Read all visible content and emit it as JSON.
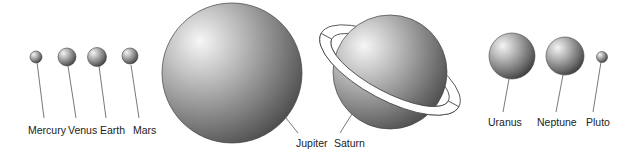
{
  "planets": [
    {
      "name": "Mercury"
    },
    {
      "name": "Venus"
    },
    {
      "name": "Earth"
    },
    {
      "name": "Mars"
    },
    {
      "name": "Jupiter"
    },
    {
      "name": "Saturn"
    },
    {
      "name": "Uranus"
    },
    {
      "name": "Neptune"
    },
    {
      "name": "Pluto"
    }
  ],
  "colors": {
    "sphere_light": "#f2f2f2",
    "sphere_mid": "#9a9a9a",
    "sphere_dark": "#3c3c3c",
    "outline": "#444444",
    "leader_line": "#555555",
    "label_text": "#222222",
    "background": "#ffffff"
  }
}
